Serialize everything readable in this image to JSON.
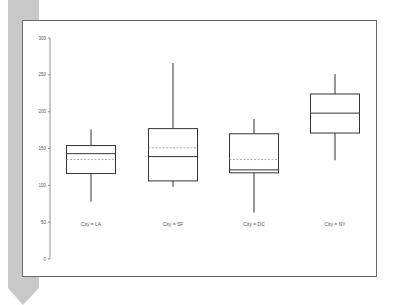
{
  "chart_data": {
    "type": "box",
    "title": "",
    "xlabel": "",
    "ylabel": "",
    "ylim": [
      0,
      300
    ],
    "yticks": [
      0,
      50,
      100,
      150,
      200,
      250,
      300
    ],
    "grid": false,
    "legend": null,
    "categories": [
      "City = LA",
      "City = SF",
      "City = DC",
      "City = NY"
    ],
    "boxes": [
      {
        "label": "City = LA",
        "whisker_low": 78,
        "q1": 116,
        "median": 143,
        "mean": 135,
        "q3": 154,
        "whisker_high": 176
      },
      {
        "label": "City = SF",
        "whisker_low": 98,
        "q1": 106,
        "median": 139,
        "mean": 151,
        "q3": 177,
        "whisker_high": 266
      },
      {
        "label": "City = DC",
        "whisker_low": 63,
        "q1": 117,
        "median": 121,
        "mean": 135,
        "q3": 170,
        "whisker_high": 190
      },
      {
        "label": "City = NY",
        "whisker_low": 134,
        "q1": 171,
        "median": 198,
        "mean": 198,
        "q3": 224,
        "whisker_high": 251
      }
    ],
    "annotations": [
      "median shown as solid line",
      "mean shown as dashed line"
    ]
  },
  "style": {
    "box_color": "#333333",
    "mean_color": "#999999",
    "axis_color": "#777777",
    "strip_color": "#c8c8c8"
  }
}
